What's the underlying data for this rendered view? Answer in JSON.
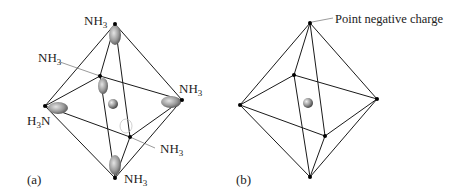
{
  "figure": {
    "panel_a": {
      "label": "(a)",
      "ligand": "NH",
      "ligand_sub": "3",
      "ligand_rev_prefix": "H",
      "ligand_rev_sub": "3",
      "ligand_rev_suffix": "N",
      "labels": {
        "top": "NH3",
        "back": "NH3",
        "right": "NH3",
        "left": "H3N",
        "front": "NH3",
        "bottom": "NH3"
      }
    },
    "panel_b": {
      "label": "(b)",
      "callout": "Point negative charge"
    },
    "colors": {
      "line": "#1a1a1a",
      "lobe_dark": "#5a5a5a",
      "lobe_light": "#d8d8d8",
      "background": "#ffffff"
    }
  }
}
